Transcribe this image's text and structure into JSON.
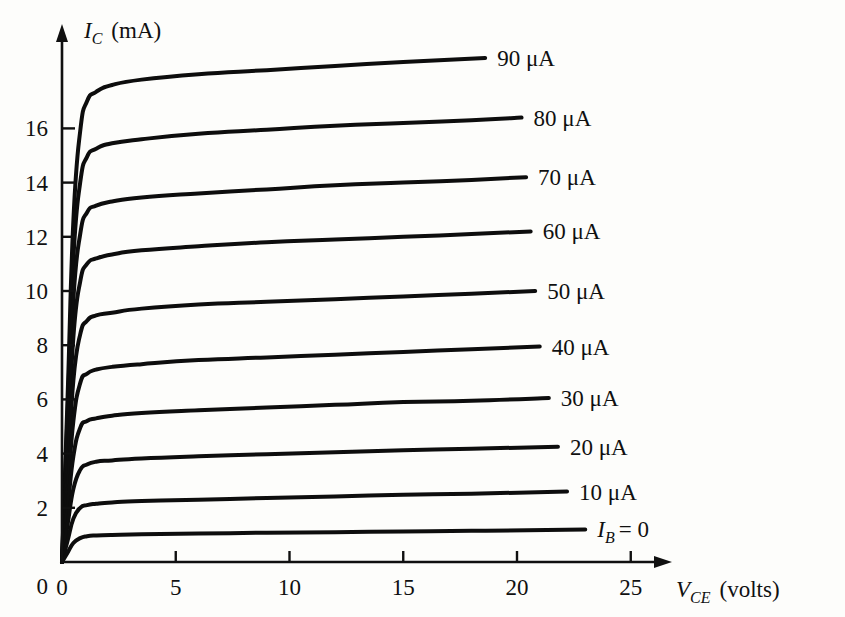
{
  "figure": {
    "name": "transistor-output-characteristics",
    "background_color": "#fdfdfb",
    "ink_color": "#101010"
  },
  "axes": {
    "y_title_symbol": "I",
    "y_title_sub": "C",
    "y_title_unit": "(mA)",
    "x_title_symbol": "V",
    "x_title_sub": "CE",
    "x_title_unit": "(volts)",
    "x_ticks": [
      "0",
      "5",
      "10",
      "15",
      "20",
      "25"
    ],
    "y_ticks": [
      "0",
      "2",
      "4",
      "6",
      "8",
      "10",
      "12",
      "14",
      "16"
    ]
  },
  "curve_labels": [
    "90 μA",
    "80 μA",
    "70 μA",
    "60 μA",
    "50 μA",
    "40 μA",
    "30 μA",
    "20 μA",
    "10 μA"
  ],
  "bottom_curve_label": {
    "symbol": "I",
    "sub": "B",
    "rest": "= 0"
  },
  "chart_data": {
    "type": "line",
    "title": "",
    "xlabel": "V_CE (volts)",
    "ylabel": "I_C (mA)",
    "xlim": [
      0,
      27.5
    ],
    "ylim": [
      0,
      18.6
    ],
    "xticks": [
      0,
      5,
      10,
      15,
      20,
      25
    ],
    "yticks": [
      0,
      2,
      4,
      6,
      8,
      10,
      12,
      14,
      16
    ],
    "grid": false,
    "legend": "inline-right-labels",
    "series": [
      {
        "name": "I_B = 90 μA",
        "base_current_uA": 90,
        "label": "90 μA",
        "x": [
          0,
          0.25,
          0.5,
          0.8,
          1.1,
          1.5,
          2.2,
          3.5,
          6,
          9,
          12,
          15,
          18.6
        ],
        "y": [
          0,
          6.2,
          12.6,
          15.9,
          17.0,
          17.35,
          17.6,
          17.8,
          18.0,
          18.15,
          18.3,
          18.45,
          18.6
        ]
      },
      {
        "name": "I_B = 80 μA",
        "base_current_uA": 80,
        "label": "80 μA",
        "x": [
          0,
          0.25,
          0.5,
          0.8,
          1.1,
          1.5,
          2.2,
          3.5,
          6,
          9,
          12,
          15,
          18,
          20.2
        ],
        "y": [
          0,
          5.6,
          11.2,
          14.0,
          14.95,
          15.25,
          15.45,
          15.6,
          15.8,
          15.95,
          16.1,
          16.2,
          16.3,
          16.4
        ]
      },
      {
        "name": "I_B = 70 μA",
        "base_current_uA": 70,
        "label": "70 μA",
        "x": [
          0,
          0.25,
          0.5,
          0.8,
          1.1,
          1.5,
          2.2,
          3.5,
          6,
          9,
          12,
          15,
          18,
          20.4
        ],
        "y": [
          0,
          4.8,
          9.7,
          12.1,
          12.9,
          13.15,
          13.3,
          13.45,
          13.6,
          13.75,
          13.9,
          14.0,
          14.1,
          14.2
        ]
      },
      {
        "name": "I_B = 60 μA",
        "base_current_uA": 60,
        "label": "60 μA",
        "x": [
          0,
          0.25,
          0.5,
          0.8,
          1.1,
          1.5,
          2.2,
          3.5,
          6,
          9,
          12,
          15,
          18,
          20.6
        ],
        "y": [
          0,
          4.1,
          8.3,
          10.35,
          11.0,
          11.2,
          11.35,
          11.5,
          11.65,
          11.8,
          11.9,
          12.0,
          12.1,
          12.2
        ]
      },
      {
        "name": "I_B = 50 μA",
        "base_current_uA": 50,
        "label": "50 μA",
        "x": [
          0,
          0.25,
          0.5,
          0.8,
          1.1,
          1.5,
          2.2,
          3.5,
          6,
          9,
          12,
          15,
          18,
          20.8
        ],
        "y": [
          0,
          3.3,
          6.7,
          8.4,
          8.9,
          9.1,
          9.2,
          9.35,
          9.5,
          9.6,
          9.7,
          9.8,
          9.9,
          10.0
        ]
      },
      {
        "name": "I_B = 40 μA",
        "base_current_uA": 40,
        "label": "40 μA",
        "x": [
          0,
          0.25,
          0.5,
          0.8,
          1.1,
          1.5,
          2.2,
          3.5,
          6,
          9,
          12,
          15,
          18,
          21.0
        ],
        "y": [
          0,
          2.6,
          5.2,
          6.6,
          6.95,
          7.1,
          7.2,
          7.3,
          7.45,
          7.55,
          7.65,
          7.75,
          7.85,
          7.95
        ]
      },
      {
        "name": "I_B = 30 μA",
        "base_current_uA": 30,
        "label": "30 μA",
        "x": [
          0,
          0.25,
          0.5,
          0.8,
          1.1,
          1.5,
          2.2,
          3.5,
          6,
          9,
          12,
          15,
          18,
          21.4
        ],
        "y": [
          0,
          2.0,
          3.9,
          4.95,
          5.2,
          5.3,
          5.4,
          5.5,
          5.6,
          5.7,
          5.8,
          5.9,
          5.95,
          6.05
        ]
      },
      {
        "name": "I_B = 20 μA",
        "base_current_uA": 20,
        "label": "20 μA",
        "x": [
          0,
          0.25,
          0.5,
          0.8,
          1.1,
          1.5,
          2.2,
          3.5,
          6,
          9,
          12,
          15,
          18,
          21.8
        ],
        "y": [
          0,
          1.4,
          2.7,
          3.4,
          3.6,
          3.7,
          3.75,
          3.82,
          3.9,
          3.98,
          4.05,
          4.12,
          4.18,
          4.25
        ]
      },
      {
        "name": "I_B = 10 μA",
        "base_current_uA": 10,
        "label": "10 μA",
        "x": [
          0,
          0.25,
          0.5,
          0.8,
          1.1,
          1.5,
          2.2,
          3.5,
          6,
          9,
          12,
          15,
          18,
          22.2
        ],
        "y": [
          0,
          0.8,
          1.6,
          2.0,
          2.1,
          2.15,
          2.2,
          2.25,
          2.3,
          2.36,
          2.42,
          2.48,
          2.52,
          2.6
        ]
      },
      {
        "name": "I_B = 0",
        "base_current_uA": 0,
        "label": "I_B = 0",
        "x": [
          0,
          0.25,
          0.5,
          0.8,
          1.1,
          1.5,
          2.2,
          3.5,
          6,
          9,
          12,
          15,
          18,
          23.0
        ],
        "y": [
          0,
          0.35,
          0.7,
          0.88,
          0.95,
          0.98,
          1.0,
          1.02,
          1.05,
          1.08,
          1.1,
          1.13,
          1.15,
          1.2
        ]
      }
    ]
  }
}
